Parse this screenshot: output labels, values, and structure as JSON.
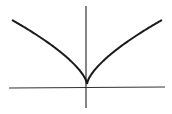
{
  "chart_data": {
    "type": "line",
    "title": "",
    "xlabel": "",
    "ylabel": "",
    "series": [
      {
        "name": "y=|x|^(2/3)",
        "x": [
          -1.0,
          -0.8,
          -0.6,
          -0.4,
          -0.2,
          -0.05,
          0,
          0.05,
          0.2,
          0.4,
          0.6,
          0.8,
          1.0
        ],
        "y": [
          1.0,
          0.86,
          0.71,
          0.54,
          0.34,
          0.14,
          0,
          0.14,
          0.34,
          0.54,
          0.71,
          0.86,
          1.0
        ]
      }
    ],
    "grid": false,
    "legend": "none",
    "ticks": "none",
    "colors": {
      "curve": "#1a1a1a",
      "axes": "#333333"
    }
  }
}
